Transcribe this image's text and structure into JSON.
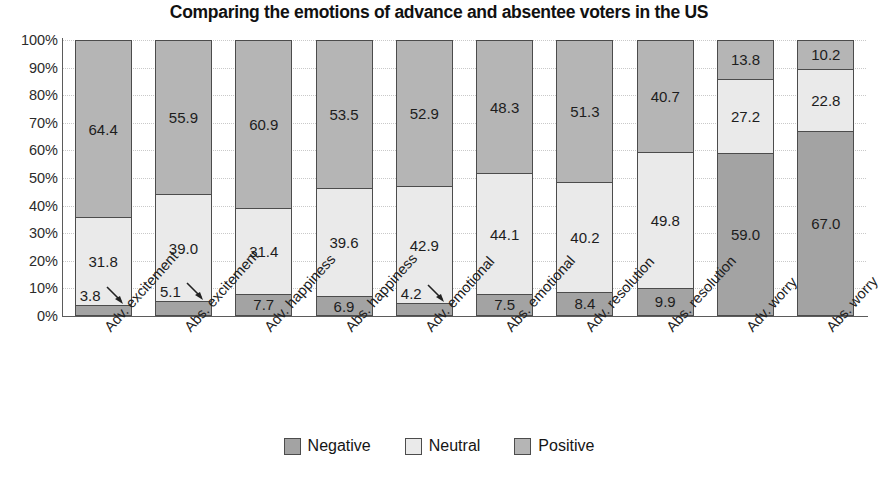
{
  "chart_data": {
    "type": "bar",
    "subtype": "stacked-percent-100",
    "title": "Comparing the emotions of advance and absentee voters in the US",
    "subtitle": "",
    "xlabel": "",
    "ylabel": "",
    "ylim": [
      0,
      100
    ],
    "ytick_labels": [
      "100%",
      "90%",
      "80%",
      "70%",
      "60%",
      "50%",
      "40%",
      "30%",
      "20%",
      "10%",
      "0%"
    ],
    "ytick_values": [
      100,
      90,
      80,
      70,
      60,
      50,
      40,
      30,
      20,
      10,
      0
    ],
    "grid": true,
    "grid_style": "dotted-horizontal",
    "legend_position": "bottom-center",
    "stack_order_bottom_to_top": [
      "Negative",
      "Neutral",
      "Positive"
    ],
    "categories": [
      "Adv. excitement",
      "Abs. excitement",
      "Adv. happiness",
      "Abs. happiness",
      "Adv. emotional",
      "Abs. emotional",
      "Adv. resolution",
      "Abs. resolution",
      "Adv. worry",
      "Abs. worry"
    ],
    "series": [
      {
        "name": "Negative",
        "color": "#a3a3a3",
        "values": [
          3.8,
          5.1,
          7.7,
          6.9,
          4.2,
          7.5,
          8.4,
          9.9,
          59.0,
          67.0
        ]
      },
      {
        "name": "Neutral",
        "color": "#eaeaea",
        "values": [
          31.8,
          39.0,
          31.4,
          39.6,
          42.9,
          44.1,
          40.2,
          49.8,
          27.2,
          22.8
        ]
      },
      {
        "name": "Positive",
        "color": "#b5b5b5",
        "values": [
          64.4,
          55.9,
          60.9,
          53.5,
          52.9,
          48.3,
          51.3,
          40.7,
          13.8,
          10.2
        ]
      }
    ],
    "bars": [
      {
        "category": "Adv. excitement",
        "segments": [
          {
            "series": "Positive",
            "value": 64.4,
            "label": "64.4",
            "callout": false
          },
          {
            "series": "Neutral",
            "value": 31.8,
            "label": "31.8",
            "callout": false
          },
          {
            "series": "Negative",
            "value": 3.8,
            "label": "3.8",
            "callout": true
          }
        ]
      },
      {
        "category": "Abs. excitement",
        "segments": [
          {
            "series": "Positive",
            "value": 55.9,
            "label": "55.9",
            "callout": false
          },
          {
            "series": "Neutral",
            "value": 39.0,
            "label": "39.0",
            "callout": false
          },
          {
            "series": "Negative",
            "value": 5.1,
            "label": "5.1",
            "callout": true
          }
        ]
      },
      {
        "category": "Adv. happiness",
        "segments": [
          {
            "series": "Positive",
            "value": 60.9,
            "label": "60.9",
            "callout": false
          },
          {
            "series": "Neutral",
            "value": 31.4,
            "label": "31.4",
            "callout": false
          },
          {
            "series": "Negative",
            "value": 7.7,
            "label": "7.7",
            "callout": false
          }
        ]
      },
      {
        "category": "Abs. happiness",
        "segments": [
          {
            "series": "Positive",
            "value": 53.5,
            "label": "53.5",
            "callout": false
          },
          {
            "series": "Neutral",
            "value": 39.6,
            "label": "39.6",
            "callout": false
          },
          {
            "series": "Negative",
            "value": 6.9,
            "label": "6.9",
            "callout": false
          }
        ]
      },
      {
        "category": "Adv. emotional",
        "segments": [
          {
            "series": "Positive",
            "value": 52.9,
            "label": "52.9",
            "callout": false
          },
          {
            "series": "Neutral",
            "value": 42.9,
            "label": "42.9",
            "callout": false
          },
          {
            "series": "Negative",
            "value": 4.2,
            "label": "4.2",
            "callout": true
          }
        ]
      },
      {
        "category": "Abs. emotional",
        "segments": [
          {
            "series": "Positive",
            "value": 48.3,
            "label": "48.3",
            "callout": false
          },
          {
            "series": "Neutral",
            "value": 44.1,
            "label": "44.1",
            "callout": false
          },
          {
            "series": "Negative",
            "value": 7.5,
            "label": "7.5",
            "callout": false
          }
        ]
      },
      {
        "category": "Adv. resolution",
        "segments": [
          {
            "series": "Positive",
            "value": 51.3,
            "label": "51.3",
            "callout": false
          },
          {
            "series": "Neutral",
            "value": 40.2,
            "label": "40.2",
            "callout": false
          },
          {
            "series": "Negative",
            "value": 8.4,
            "label": "8.4",
            "callout": false
          }
        ]
      },
      {
        "category": "Abs. resolution",
        "segments": [
          {
            "series": "Positive",
            "value": 40.7,
            "label": "40.7",
            "callout": false
          },
          {
            "series": "Neutral",
            "value": 49.8,
            "label": "49.8",
            "callout": false
          },
          {
            "series": "Negative",
            "value": 9.9,
            "label": "9.9",
            "callout": false
          }
        ]
      },
      {
        "category": "Adv. worry",
        "segments": [
          {
            "series": "Positive",
            "value": 13.8,
            "label": "13.8",
            "callout": false
          },
          {
            "series": "Neutral",
            "value": 27.2,
            "label": "27.2",
            "callout": false
          },
          {
            "series": "Negative",
            "value": 59.0,
            "label": "59.0",
            "callout": false
          }
        ]
      },
      {
        "category": "Abs. worry",
        "segments": [
          {
            "series": "Positive",
            "value": 10.2,
            "label": "10.2",
            "callout": false
          },
          {
            "series": "Neutral",
            "value": 22.8,
            "label": "22.8",
            "callout": false
          },
          {
            "series": "Negative",
            "value": 67.0,
            "label": "67.0",
            "callout": false
          }
        ]
      }
    ],
    "legend": [
      {
        "label": "Negative",
        "color": "#a3a3a3"
      },
      {
        "label": "Neutral",
        "color": "#eaeaea"
      },
      {
        "label": "Positive",
        "color": "#b5b5b5"
      }
    ]
  }
}
